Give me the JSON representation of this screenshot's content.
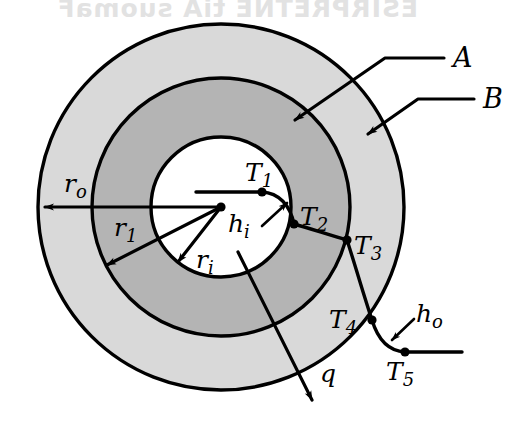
{
  "figure": {
    "type": "engineering-diagram",
    "background_color": "#ffffff",
    "canvas": {
      "width": 531,
      "height": 431
    }
  },
  "geometry": {
    "center": {
      "x": 221,
      "y": 207
    },
    "circles": [
      {
        "name": "inner-surface",
        "radius": 70,
        "fill": "#ffffff",
        "label_radius": "r_i"
      },
      {
        "name": "layer-A-outer-surface",
        "radius": 129,
        "fill": "#b4b4b4",
        "label_radius": "r_1"
      },
      {
        "name": "layer-B-outer-surface",
        "radius": 183,
        "fill": "#d9d9d9",
        "label_radius": "r_o"
      }
    ]
  },
  "colors": {
    "layer_a_fill": "#b4b4b4",
    "layer_b_fill": "#d9d9d9",
    "core_fill": "#ffffff",
    "stroke": "#000000",
    "ghost_text": "#e2e2e2"
  },
  "labels": {
    "material_a": {
      "text": "A",
      "x": 457,
      "y": 64,
      "leader": "arrow pointing into inner annulus"
    },
    "material_b": {
      "text": "B",
      "x": 487,
      "y": 104,
      "leader": "arrow pointing into outer annulus"
    },
    "heat_flow": {
      "text": "q",
      "x": 326,
      "y": 375,
      "leader": "radial outward arrow"
    },
    "radius_outer": {
      "base": "r",
      "sub": "o",
      "x": 68,
      "y": 188
    },
    "radius_mid": {
      "base": "r",
      "sub": "1",
      "x": 119,
      "y": 232
    },
    "radius_inner": {
      "base": "r",
      "sub": "i",
      "x": 200,
      "y": 265
    },
    "coef_inner": {
      "base": "h",
      "sub": "i",
      "x": 245,
      "y": 228
    },
    "coef_outer": {
      "base": "h",
      "sub": "o",
      "x": 424,
      "y": 323
    },
    "temp_1": {
      "base": "T",
      "sub": "1",
      "x": 256,
      "y": 178
    },
    "temp_2": {
      "base": "T",
      "sub": "2",
      "x": 309,
      "y": 225
    },
    "temp_3": {
      "base": "T",
      "sub": "3",
      "x": 359,
      "y": 250
    },
    "temp_4": {
      "base": "T",
      "sub": "4",
      "x": 338,
      "y": 330
    },
    "temp_5": {
      "base": "T",
      "sub": "5",
      "x": 393,
      "y": 376
    }
  },
  "nodes": [
    {
      "name": "center-point",
      "x": 221,
      "y": 207
    },
    {
      "name": "T1-point",
      "x": 262,
      "y": 192
    },
    {
      "name": "T2-point",
      "x": 294,
      "y": 224
    },
    {
      "name": "T3-point",
      "x": 347,
      "y": 240
    },
    {
      "name": "T4-point",
      "x": 372,
      "y": 320
    },
    {
      "name": "T5-point",
      "x": 405,
      "y": 352
    }
  ],
  "ghost": {
    "line1": "ESIRPRETNE tiA suomaF",
    "line2": "noitcudnoC laidaR"
  },
  "annotations": {
    "description": "Temperature profile curve descends from T1 through the inner convective film, across material A (T2 to T3), across material B (T3 to T4) and through the outer convective film to the ambient temperature T5.",
    "inner_convection": "h_i",
    "outer_convection": "h_o"
  }
}
